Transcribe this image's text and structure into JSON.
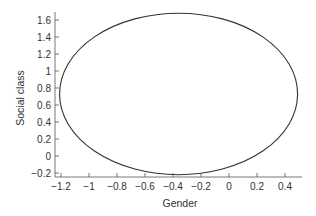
{
  "chart_data": {
    "type": "line",
    "subtype": "ellipse",
    "title": "",
    "xlabel": "Gender",
    "ylabel": "Social class",
    "xlim": [
      -1.25,
      0.52
    ],
    "ylim": [
      -0.25,
      1.68
    ],
    "xticks": [
      -1.2,
      -1,
      -0.8,
      -0.6,
      -0.4,
      -0.2,
      0,
      0.2,
      0.4
    ],
    "xtick_labels": [
      "−1.2",
      "−1",
      "−0.8",
      "−0.6",
      "−0.4",
      "−0.2",
      "0",
      "0.2",
      "0.4"
    ],
    "yticks": [
      -0.2,
      0,
      0.2,
      0.4,
      0.6,
      0.8,
      1,
      1.2,
      1.4,
      1.6
    ],
    "ytick_labels": [
      "−0.2",
      "0",
      "0.2",
      "0.4",
      "0.6",
      "0.8",
      "1",
      "1.2",
      "1.4",
      "1.6"
    ],
    "grid": false,
    "legend": null,
    "series": [
      {
        "name": "ellipse",
        "shape": "ellipse",
        "center": [
          -0.36,
          0.73
        ],
        "semi_axis_x": 0.85,
        "semi_axis_y": 0.95,
        "x_extent": [
          -1.21,
          0.49
        ],
        "y_extent": [
          -0.22,
          1.68
        ],
        "color": "#333333"
      }
    ]
  }
}
